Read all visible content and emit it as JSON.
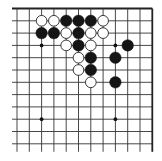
{
  "diagram": {
    "type": "go-board-fragment",
    "corner": "top-right",
    "colors": {
      "background": "#ffffff",
      "line": "#333333",
      "edge": "#222222",
      "black_stone": "#151515",
      "white_stone": "#ffffff",
      "white_stone_outline": "#222222",
      "hoshi": "#111111"
    },
    "grid": {
      "origin_x": 17,
      "origin_y": 8.5,
      "spacing": 12.3,
      "columns": 12,
      "rows": 12,
      "left_extension": 5,
      "bottom_extension": 8,
      "top_edge": true,
      "right_edge": true
    },
    "hoshi": [
      {
        "col": 2,
        "row": 3
      },
      {
        "col": 8,
        "row": 3
      },
      {
        "col": 2,
        "row": 9
      },
      {
        "col": 8,
        "row": 9
      }
    ],
    "stones": [
      {
        "color": "white",
        "col": 2,
        "row": 1
      },
      {
        "color": "white",
        "col": 3,
        "row": 1
      },
      {
        "color": "black",
        "col": 4,
        "row": 1
      },
      {
        "color": "black",
        "col": 5,
        "row": 1
      },
      {
        "color": "black",
        "col": 6,
        "row": 1
      },
      {
        "color": "white",
        "col": 7,
        "row": 1
      },
      {
        "color": "black",
        "col": 2,
        "row": 2
      },
      {
        "color": "black",
        "col": 3,
        "row": 2
      },
      {
        "color": "white",
        "col": 4,
        "row": 2
      },
      {
        "color": "black",
        "col": 5,
        "row": 2
      },
      {
        "color": "white",
        "col": 6,
        "row": 2
      },
      {
        "color": "white",
        "col": 7,
        "row": 2
      },
      {
        "color": "white",
        "col": 4,
        "row": 3
      },
      {
        "color": "black",
        "col": 5,
        "row": 3
      },
      {
        "color": "white",
        "col": 6,
        "row": 3
      },
      {
        "color": "black",
        "col": 9,
        "row": 3
      },
      {
        "color": "white",
        "col": 5,
        "row": 4
      },
      {
        "color": "black",
        "col": 6,
        "row": 4
      },
      {
        "color": "black",
        "col": 8,
        "row": 4
      },
      {
        "color": "white",
        "col": 5,
        "row": 5
      },
      {
        "color": "black",
        "col": 6,
        "row": 5
      },
      {
        "color": "white",
        "col": 6,
        "row": 6
      },
      {
        "color": "black",
        "col": 8,
        "row": 6
      }
    ]
  }
}
